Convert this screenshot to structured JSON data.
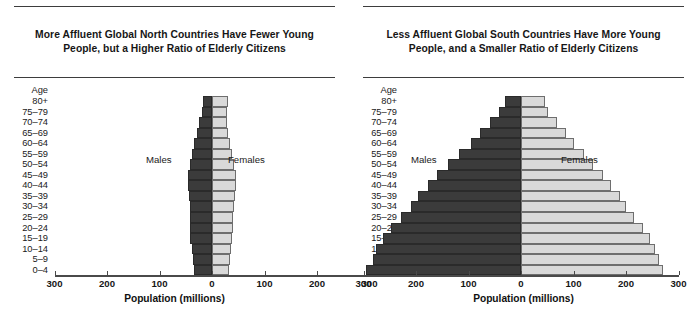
{
  "figure": {
    "axis_title": "Population (millions)",
    "age_header": "Age",
    "male_label": "Males",
    "female_label": "Females",
    "male_color": "#3b3b3b",
    "female_color": "#d9d9d9",
    "tick_labels": [
      "300",
      "200",
      "100",
      "0",
      "100",
      "200",
      "300"
    ]
  },
  "chart_data": [
    {
      "type": "bar",
      "subtype": "population-pyramid",
      "title": "More Affluent Global North Countries Have Fewer Young People, but a Higher Ratio of Elderly Citizens",
      "xlabel": "Population (millions)",
      "ylabel": "Age",
      "xlim": [
        -300,
        300
      ],
      "xticks": [
        -300,
        -200,
        -100,
        0,
        100,
        200,
        300
      ],
      "xticklabels": [
        "300",
        "200",
        "100",
        "0",
        "100",
        "200",
        "300"
      ],
      "grid": false,
      "legend": [
        "Males",
        "Females"
      ],
      "legend_position": "inside-center",
      "categories": [
        "80+",
        "75–79",
        "70–74",
        "65–69",
        "60–64",
        "55–59",
        "50–54",
        "45–49",
        "40–44",
        "35–39",
        "30–34",
        "25–29",
        "20–24",
        "15–19",
        "10–14",
        "5–9",
        "0–4"
      ],
      "series": [
        {
          "name": "Males",
          "side": "left",
          "values": [
            18,
            20,
            24,
            28,
            34,
            38,
            41,
            46,
            46,
            44,
            42,
            42,
            42,
            41,
            38,
            36,
            34
          ]
        },
        {
          "name": "Females",
          "side": "right",
          "values": [
            30,
            28,
            28,
            30,
            34,
            38,
            41,
            45,
            45,
            43,
            41,
            40,
            40,
            39,
            36,
            34,
            32
          ]
        }
      ]
    },
    {
      "type": "bar",
      "subtype": "population-pyramid",
      "title": "Less Affluent Global South Countries Have More Young People, and a Smaller Ratio of Elderly Citizens",
      "xlabel": "Population (millions)",
      "ylabel": "Age",
      "xlim": [
        -300,
        300
      ],
      "xticks": [
        -300,
        -200,
        -100,
        0,
        100,
        200,
        300
      ],
      "xticklabels": [
        "300",
        "200",
        "100",
        "0",
        "100",
        "200",
        "300"
      ],
      "grid": false,
      "legend": [
        "Males",
        "Females"
      ],
      "legend_position": "inside-center",
      "categories": [
        "80+",
        "75–79",
        "70–74",
        "65–69",
        "60–64",
        "55–59",
        "50–54",
        "45–49",
        "40–44",
        "35–39",
        "30–34",
        "25–29",
        "20–24",
        "15–19",
        "10–14",
        "5–9",
        "0–4"
      ],
      "series": [
        {
          "name": "Males",
          "side": "left",
          "values": [
            30,
            42,
            60,
            78,
            96,
            118,
            140,
            160,
            178,
            196,
            210,
            228,
            248,
            262,
            276,
            282,
            295
          ]
        },
        {
          "name": "Females",
          "side": "right",
          "values": [
            45,
            52,
            68,
            85,
            100,
            120,
            138,
            156,
            172,
            188,
            200,
            215,
            232,
            246,
            256,
            262,
            270
          ]
        }
      ]
    }
  ],
  "panels": [
    {
      "title": "More Affluent Global North Countries Have Fewer Young People, but a Higher Ratio of Elderly Citizens",
      "chart_index": 0
    },
    {
      "title": "Less Affluent Global South Countries Have More Young People, and a Smaller Ratio of Elderly Citizens",
      "chart_index": 1
    }
  ]
}
